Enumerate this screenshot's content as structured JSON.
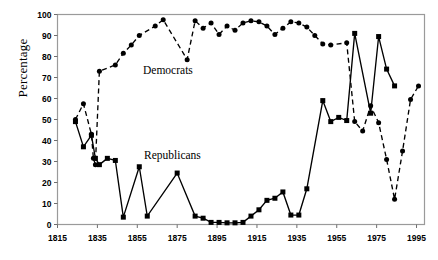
{
  "chart_data": {
    "type": "line",
    "title": "",
    "xlabel": "",
    "ylabel": "Percentage",
    "xlim": [
      1815,
      1999
    ],
    "ylim": [
      0,
      100
    ],
    "xticks": [
      1815,
      1835,
      1855,
      1875,
      1895,
      1915,
      1935,
      1955,
      1975,
      1995
    ],
    "yticks": [
      0,
      10,
      20,
      30,
      40,
      50,
      60,
      70,
      80,
      90,
      100
    ],
    "grid": false,
    "legend_position": "inline-annotation",
    "annotations": [
      {
        "text": "Democrats",
        "x": 1872,
        "y": 68
      },
      {
        "text": "Republicans",
        "x": 1873,
        "y": 33
      }
    ],
    "series": [
      {
        "name": "Democrats",
        "linestyle": "dashed",
        "marker": "circle",
        "color": "#000000",
        "points": [
          [
            1824,
            50.0
          ],
          [
            1828,
            57.5
          ],
          [
            1832,
            43.0
          ],
          [
            1833,
            31.5
          ],
          [
            1834,
            28.5
          ],
          [
            1836,
            73.0
          ],
          [
            1844,
            76.0
          ],
          [
            1848,
            81.5
          ],
          [
            1852,
            85.5
          ],
          [
            1856,
            90.0
          ],
          [
            1864,
            94.5
          ],
          [
            1868,
            97.5
          ],
          [
            1880,
            78.5
          ],
          [
            1884,
            97.0
          ],
          [
            1888,
            93.5
          ],
          [
            1892,
            96.0
          ],
          [
            1896,
            90.5
          ],
          [
            1900,
            94.5
          ],
          [
            1904,
            92.5
          ],
          [
            1908,
            96.0
          ],
          [
            1912,
            97.0
          ],
          [
            1916,
            96.5
          ],
          [
            1920,
            94.5
          ],
          [
            1924,
            90.5
          ],
          [
            1928,
            93.5
          ],
          [
            1932,
            96.5
          ],
          [
            1936,
            96.0
          ],
          [
            1940,
            94.0
          ],
          [
            1944,
            90.0
          ],
          [
            1948,
            86.0
          ],
          [
            1952,
            85.5
          ],
          [
            1960,
            86.5
          ],
          [
            1964,
            49.0
          ],
          [
            1968,
            44.5
          ],
          [
            1972,
            56.5
          ],
          [
            1976,
            48.5
          ],
          [
            1980,
            31.0
          ],
          [
            1984,
            12.0
          ],
          [
            1988,
            35.0
          ],
          [
            1992,
            59.5
          ],
          [
            1996,
            66.0
          ]
        ]
      },
      {
        "name": "Republicans",
        "linestyle": "solid",
        "marker": "square",
        "color": "#000000",
        "points": [
          [
            1824,
            49.0
          ],
          [
            1828,
            37.0
          ],
          [
            1832,
            42.5
          ],
          [
            1834,
            31.5
          ],
          [
            1836,
            28.5
          ],
          [
            1840,
            31.5
          ],
          [
            1844,
            30.5
          ],
          [
            1848,
            3.5
          ],
          [
            1856,
            27.5
          ],
          [
            1860,
            4.0
          ],
          [
            1875,
            24.5
          ],
          [
            1884,
            4.0
          ],
          [
            1888,
            3.0
          ],
          [
            1892,
            1.0
          ],
          [
            1896,
            1.0
          ],
          [
            1900,
            0.8
          ],
          [
            1904,
            0.8
          ],
          [
            1908,
            1.0
          ],
          [
            1912,
            4.0
          ],
          [
            1916,
            7.0
          ],
          [
            1920,
            11.5
          ],
          [
            1924,
            12.5
          ],
          [
            1928,
            15.5
          ],
          [
            1932,
            4.5
          ],
          [
            1936,
            4.5
          ],
          [
            1940,
            17.0
          ],
          [
            1948,
            59.0
          ],
          [
            1952,
            49.0
          ],
          [
            1956,
            51.0
          ],
          [
            1960,
            49.5
          ],
          [
            1964,
            91.0
          ],
          [
            1972,
            53.0
          ],
          [
            1976,
            89.5
          ],
          [
            1980,
            74.0
          ],
          [
            1984,
            66.0
          ]
        ]
      }
    ]
  }
}
